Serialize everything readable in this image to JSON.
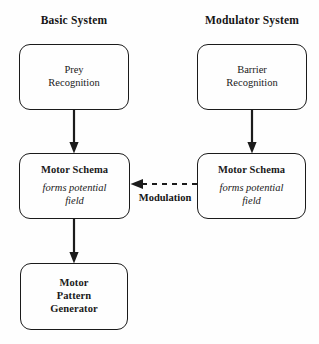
{
  "diagram": {
    "title_left": "Basic System",
    "title_right": "Modulator System",
    "nodes": {
      "prey": {
        "line1": "Prey",
        "line2": "Recognition"
      },
      "barrier": {
        "line1": "Barrier",
        "line2": "Recognition"
      },
      "motor_schema_left": {
        "heading": "Motor Schema",
        "line1": "forms potential",
        "line2": "field"
      },
      "motor_schema_right": {
        "heading": "Motor Schema",
        "line1": "forms potential",
        "line2": "field"
      },
      "mpg": {
        "line1": "Motor",
        "line2": "Pattern",
        "line3": "Generator"
      }
    },
    "edges": {
      "modulation_label": "Modulation"
    },
    "colors": {
      "stroke": "#1b1b1b",
      "background": "#fefefe",
      "text": "#151515"
    }
  }
}
